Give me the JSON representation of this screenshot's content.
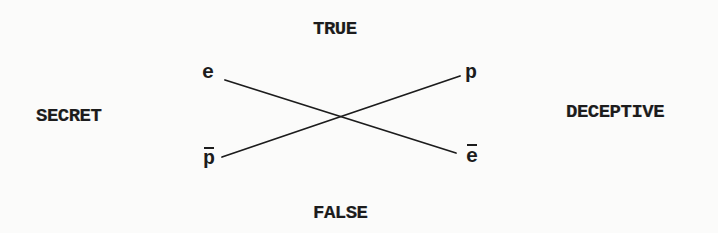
{
  "diagram": {
    "type": "logical-square-cross",
    "axis_labels": {
      "top": "TRUE",
      "bottom": "FALSE",
      "left": "SECRET",
      "right": "DECEPTIVE"
    },
    "nodes": {
      "top_left": {
        "symbol": "e",
        "negated": false
      },
      "top_right": {
        "symbol": "p",
        "negated": false
      },
      "bottom_left": {
        "symbol": "p",
        "negated": true
      },
      "bottom_right": {
        "symbol": "e",
        "negated": true
      }
    },
    "edges": [
      {
        "from": "top_left",
        "to": "bottom_right"
      },
      {
        "from": "bottom_left",
        "to": "top_right"
      }
    ],
    "colors": {
      "ink": "#1c1c1c",
      "background": "#fbfbfa"
    }
  }
}
